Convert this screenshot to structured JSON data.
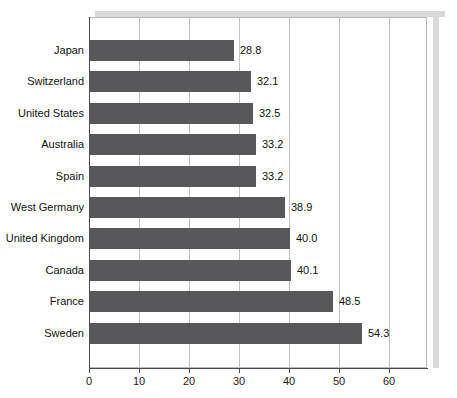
{
  "chart_data": {
    "type": "bar",
    "orientation": "horizontal",
    "title": "",
    "subtitle": "",
    "xlabel": "",
    "ylabel": "",
    "xlim": [
      0,
      67.6
    ],
    "ylim": null,
    "grid": true,
    "grid_axis": "x",
    "legend": null,
    "legend_position": "none",
    "xticks": [
      0,
      10,
      20,
      30,
      40,
      50,
      60
    ],
    "xtick_labels": [
      "0",
      "10",
      "20",
      "30",
      "40",
      "50",
      "60"
    ],
    "categories": [
      "Japan",
      "Switzerland",
      "United States",
      "Australia",
      "Spain",
      "West Germany",
      "United Kingdom",
      "Canada",
      "France",
      "Sweden"
    ],
    "values": [
      28.8,
      32.1,
      32.5,
      33.2,
      33.2,
      38.9,
      40.0,
      40.1,
      48.5,
      54.3
    ],
    "value_labels": [
      "28.8",
      "32.1",
      "32.5",
      "33.2",
      "33.2",
      "38.9",
      "40.0",
      "40.1",
      "48.5",
      "54.3"
    ],
    "bar_color": "#58585a",
    "grid_color": "#c2c2c2",
    "axis_color": "#4a4a4a",
    "background_color": "#ffffff",
    "shadow_color": "#d9d9d9"
  }
}
